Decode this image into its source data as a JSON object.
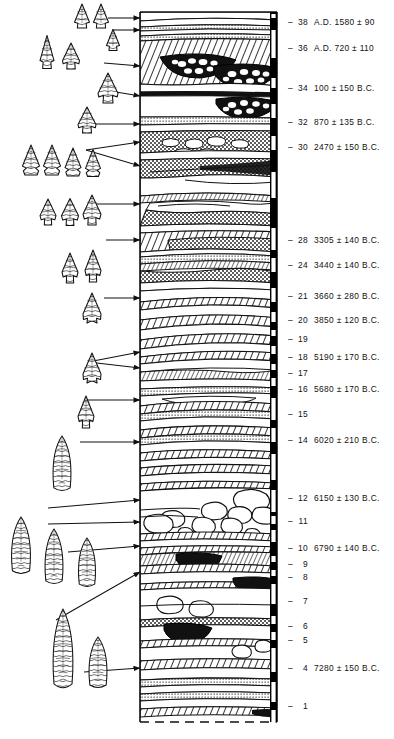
{
  "figure": {
    "kind": "archaeological-stratigraphic-column",
    "column": {
      "left": 140,
      "right": 277,
      "top": 12,
      "bottom": 722
    },
    "scalebar": {
      "x": 270,
      "width": 7,
      "color": "#000000",
      "tick_color": "#ffffff"
    }
  },
  "strata_labels": [
    {
      "num": "38",
      "date": "A.D. 1580 ± 90",
      "y": 22
    },
    {
      "num": "36",
      "date": "A.D. 720 ± 110",
      "y": 48
    },
    {
      "num": "34",
      "date": "100 ± 150 B.C.",
      "y": 88
    },
    {
      "num": "32",
      "date": "870 ± 135 B.C.",
      "y": 122
    },
    {
      "num": "30",
      "date": "2470 ± 150 B.C.",
      "y": 147
    },
    {
      "num": "28",
      "date": "3305 ± 140 B.C.",
      "y": 240
    },
    {
      "num": "24",
      "date": "3440 ± 140 B.C.",
      "y": 265
    },
    {
      "num": "21",
      "date": "3660 ± 280 B.C.",
      "y": 296
    },
    {
      "num": "20",
      "date": "3850 ± 120 B.C.",
      "y": 320
    },
    {
      "num": "19",
      "date": "",
      "y": 339
    },
    {
      "num": "18",
      "date": "5190 ± 170 B.C.",
      "y": 357
    },
    {
      "num": "17",
      "date": "",
      "y": 373
    },
    {
      "num": "16",
      "date": "5680 ± 170 B.C.",
      "y": 389
    },
    {
      "num": "15",
      "date": "",
      "y": 414
    },
    {
      "num": "14",
      "date": "6020 ± 210 B.C.",
      "y": 440
    },
    {
      "num": "12",
      "date": "6150 ± 130 B.C.",
      "y": 498
    },
    {
      "num": "11",
      "date": "",
      "y": 521
    },
    {
      "num": "10",
      "date": "6790 ± 140 B.C.",
      "y": 548
    },
    {
      "num": "9",
      "date": "",
      "y": 564
    },
    {
      "num": "8",
      "date": "",
      "y": 577
    },
    {
      "num": "7",
      "date": "",
      "y": 601
    },
    {
      "num": "6",
      "date": "",
      "y": 626
    },
    {
      "num": "5",
      "date": "",
      "y": 640
    },
    {
      "num": "4",
      "date": "7280 ± 150 B.C.",
      "y": 668
    },
    {
      "num": "1",
      "date": "",
      "y": 706
    }
  ],
  "scalebar_ticks": [
    {
      "y": 14,
      "h": 4
    },
    {
      "y": 30,
      "h": 28
    },
    {
      "y": 78,
      "h": 10
    },
    {
      "y": 104,
      "h": 14
    },
    {
      "y": 136,
      "h": 14
    },
    {
      "y": 172,
      "h": 26
    },
    {
      "y": 228,
      "h": 22
    },
    {
      "y": 258,
      "h": 14
    },
    {
      "y": 288,
      "h": 14
    },
    {
      "y": 312,
      "h": 10
    },
    {
      "y": 330,
      "h": 6
    },
    {
      "y": 346,
      "h": 8
    },
    {
      "y": 364,
      "h": 6
    },
    {
      "y": 378,
      "h": 8
    },
    {
      "y": 398,
      "h": 22
    },
    {
      "y": 428,
      "h": 14
    },
    {
      "y": 454,
      "h": 26
    },
    {
      "y": 490,
      "h": 22
    },
    {
      "y": 516,
      "h": 8
    },
    {
      "y": 530,
      "h": 12
    },
    {
      "y": 556,
      "h": 6
    },
    {
      "y": 570,
      "h": 6
    },
    {
      "y": 584,
      "h": 20
    },
    {
      "y": 616,
      "h": 8
    },
    {
      "y": 632,
      "h": 8
    },
    {
      "y": 648,
      "h": 24
    },
    {
      "y": 682,
      "h": 20
    },
    {
      "y": 710,
      "h": 14
    }
  ],
  "arrows": [
    {
      "name": "arrow-to-38",
      "x1": 108,
      "y1": 18,
      "x2": 140,
      "y2": 18
    },
    {
      "name": "arrow-to-37",
      "x1": 112,
      "y1": 30,
      "x2": 140,
      "y2": 30
    },
    {
      "name": "arrow-to-36",
      "x1": 104,
      "y1": 63,
      "x2": 140,
      "y2": 66
    },
    {
      "name": "arrow-to-34",
      "x1": 104,
      "y1": 90,
      "x2": 140,
      "y2": 96
    },
    {
      "name": "arrow-to-32",
      "x1": 96,
      "y1": 124,
      "x2": 140,
      "y2": 124
    },
    {
      "name": "arrow-to-30a",
      "x1": 86,
      "y1": 150,
      "x2": 140,
      "y2": 142
    },
    {
      "name": "arrow-to-30b",
      "x1": 86,
      "y1": 150,
      "x2": 140,
      "y2": 166
    },
    {
      "name": "arrow-to-28",
      "x1": 92,
      "y1": 204,
      "x2": 140,
      "y2": 204
    },
    {
      "name": "arrow-to-24",
      "x1": 106,
      "y1": 240,
      "x2": 140,
      "y2": 240
    },
    {
      "name": "arrow-to-21",
      "x1": 104,
      "y1": 298,
      "x2": 140,
      "y2": 298
    },
    {
      "name": "arrow-to-18a",
      "x1": 88,
      "y1": 362,
      "x2": 140,
      "y2": 352
    },
    {
      "name": "arrow-to-18b",
      "x1": 88,
      "y1": 362,
      "x2": 140,
      "y2": 368
    },
    {
      "name": "arrow-to-15",
      "x1": 84,
      "y1": 400,
      "x2": 140,
      "y2": 400
    },
    {
      "name": "arrow-to-14",
      "x1": 80,
      "y1": 442,
      "x2": 140,
      "y2": 442
    },
    {
      "name": "arrow-to-12",
      "x1": 48,
      "y1": 508,
      "x2": 140,
      "y2": 500
    },
    {
      "name": "arrow-to-11",
      "x1": 48,
      "y1": 524,
      "x2": 140,
      "y2": 522
    },
    {
      "name": "arrow-to-10",
      "x1": 68,
      "y1": 552,
      "x2": 140,
      "y2": 546
    },
    {
      "name": "arrow-to-8",
      "x1": 56,
      "y1": 620,
      "x2": 140,
      "y2": 572
    },
    {
      "name": "arrow-to-4",
      "x1": 84,
      "y1": 672,
      "x2": 140,
      "y2": 668
    }
  ],
  "points": [
    {
      "name": "point-38a",
      "cx": 82,
      "cy": 16,
      "w": 15,
      "h": 24,
      "style": "triangular-notched"
    },
    {
      "name": "point-38b",
      "cx": 101,
      "cy": 16,
      "w": 15,
      "h": 24,
      "style": "triangular-notched"
    },
    {
      "name": "point-37",
      "cx": 113,
      "cy": 40,
      "w": 13,
      "h": 21,
      "style": "triangular-notched"
    },
    {
      "name": "point-36a",
      "cx": 47,
      "cy": 52,
      "w": 14,
      "h": 33,
      "style": "elongate-triangular"
    },
    {
      "name": "point-36b",
      "cx": 71,
      "cy": 56,
      "w": 17,
      "h": 26,
      "style": "triangular-corner-notched"
    },
    {
      "name": "point-34",
      "cx": 108,
      "cy": 88,
      "w": 20,
      "h": 30,
      "style": "corner-notched-barbed"
    },
    {
      "name": "point-32",
      "cx": 87,
      "cy": 120,
      "w": 18,
      "h": 26,
      "style": "corner-notched-barbed"
    },
    {
      "name": "point-30a",
      "cx": 31,
      "cy": 160,
      "w": 17,
      "h": 30,
      "style": "side-notched"
    },
    {
      "name": "point-30b",
      "cx": 52,
      "cy": 160,
      "w": 17,
      "h": 30,
      "style": "side-notched"
    },
    {
      "name": "point-30c",
      "cx": 73,
      "cy": 162,
      "w": 16,
      "h": 28,
      "style": "side-notched"
    },
    {
      "name": "point-30d",
      "cx": 93,
      "cy": 163,
      "w": 15,
      "h": 27,
      "style": "side-notched"
    },
    {
      "name": "point-28a",
      "cx": 48,
      "cy": 212,
      "w": 16,
      "h": 26,
      "style": "stemmed-barbed"
    },
    {
      "name": "point-28b",
      "cx": 70,
      "cy": 212,
      "w": 17,
      "h": 27,
      "style": "stemmed-barbed"
    },
    {
      "name": "point-28c",
      "cx": 92,
      "cy": 210,
      "w": 18,
      "h": 30,
      "style": "stemmed-barbed"
    },
    {
      "name": "point-24a",
      "cx": 70,
      "cy": 268,
      "w": 16,
      "h": 30,
      "style": "stemmed"
    },
    {
      "name": "point-24b",
      "cx": 93,
      "cy": 266,
      "w": 16,
      "h": 32,
      "style": "stemmed"
    },
    {
      "name": "point-21",
      "cx": 92,
      "cy": 308,
      "w": 18,
      "h": 30,
      "style": "basal-notched"
    },
    {
      "name": "point-18",
      "cx": 92,
      "cy": 368,
      "w": 18,
      "h": 30,
      "style": "basal-notched"
    },
    {
      "name": "point-15",
      "cx": 86,
      "cy": 412,
      "w": 16,
      "h": 32,
      "style": "stemmed-narrow"
    },
    {
      "name": "point-14",
      "cx": 62,
      "cy": 463,
      "w": 19,
      "h": 54,
      "style": "lanceolate"
    },
    {
      "name": "point-12",
      "cx": 21,
      "cy": 545,
      "w": 20,
      "h": 56,
      "style": "lanceolate"
    },
    {
      "name": "point-11",
      "cx": 54,
      "cy": 556,
      "w": 19,
      "h": 54,
      "style": "lanceolate"
    },
    {
      "name": "point-10",
      "cx": 87,
      "cy": 562,
      "w": 18,
      "h": 48,
      "style": "lanceolate"
    },
    {
      "name": "point-4a",
      "cx": 63,
      "cy": 648,
      "w": 21,
      "h": 78,
      "style": "lanceolate-large"
    },
    {
      "name": "point-4b",
      "cx": 98,
      "cy": 662,
      "w": 19,
      "h": 50,
      "style": "lanceolate"
    }
  ]
}
